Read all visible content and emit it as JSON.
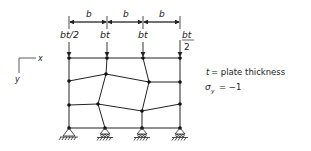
{
  "diagram": {
    "dimensions": {
      "spacing_labels": [
        "b",
        "b",
        "b"
      ]
    },
    "loads": [
      "bt/2",
      "bt",
      "bt",
      "bt",
      "2"
    ],
    "axes": {
      "x_label": "x",
      "y_label": "y"
    },
    "legend": {
      "t_symbol": "t",
      "t_definition": "= plate thickness",
      "sigma_symbol": "σ",
      "sigma_sub": "y",
      "sigma_value": "= −1"
    }
  }
}
